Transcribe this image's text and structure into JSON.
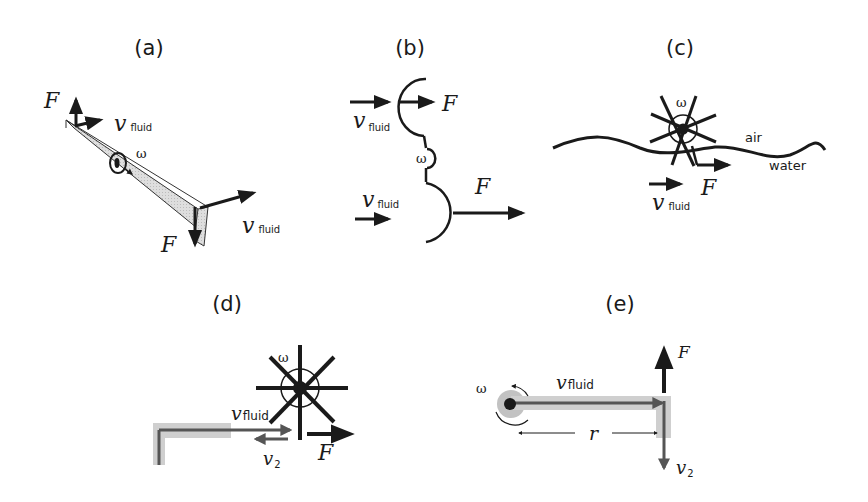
{
  "figure": {
    "panels": [
      {
        "id": "a",
        "label": "(a)",
        "description": "Tapered wing rotating about axis",
        "labels": {
          "force_top": "F",
          "velocity_top": "v",
          "velocity_top_sub": "fluid",
          "omega": "ω",
          "velocity_bottom": "v",
          "velocity_bottom_sub": "fluid",
          "force_bottom": "F"
        }
      },
      {
        "id": "b",
        "label": "(b)",
        "description": "Cup anemometer style cups",
        "labels": {
          "velocity_top": "v",
          "velocity_top_sub": "fluid",
          "force_top": "F",
          "omega": "ω",
          "velocity_bottom": "v",
          "velocity_bottom_sub": "fluid",
          "force_bottom": "F"
        }
      },
      {
        "id": "c",
        "label": "(c)",
        "description": "Paddle wheel at air-water interface",
        "labels": {
          "omega": "ω",
          "air": "air",
          "water": "water",
          "velocity": "v",
          "velocity_sub": "fluid",
          "force": "F"
        }
      },
      {
        "id": "d",
        "label": "(d)",
        "description": "Jet impinging on paddle wheel",
        "labels": {
          "omega": "ω",
          "velocity_fluid": "v",
          "velocity_fluid_sub": "fluid",
          "velocity_2": "v",
          "velocity_2_sub": "2",
          "force": "F"
        }
      },
      {
        "id": "e",
        "label": "(e)",
        "description": "Rotating arm with nozzle (lawn sprinkler)",
        "labels": {
          "omega": "ω",
          "velocity_fluid": "v",
          "velocity_fluid_sub": "fluid",
          "force": "F",
          "radius": "r",
          "velocity_2": "v",
          "velocity_2_sub": "2"
        }
      }
    ],
    "colors": {
      "ink": "#1a1a1a",
      "shade": "#d4d4d4",
      "pipe": "#b5b5b5",
      "background": "#ffffff"
    }
  }
}
